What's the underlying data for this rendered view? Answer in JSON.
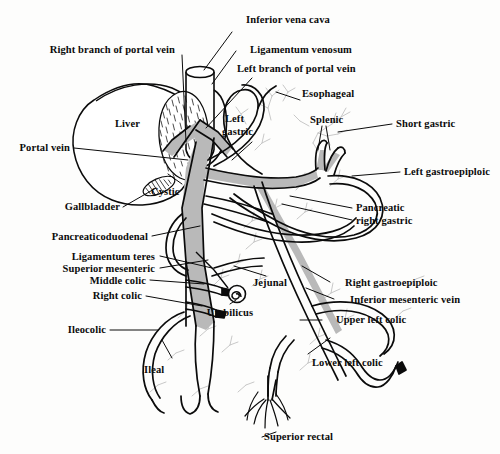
{
  "figure": {
    "background_color": "#fdfdfc",
    "ink_color": "#0b0b0b",
    "vessel_fill_color": "#b9b9b9",
    "faint_branch_color": "#bdbdbd"
  },
  "labels": {
    "inferior_vena_cava": "Inferior vena cava",
    "ligamentum_venosum": "Ligamentum venosum",
    "left_branch_of_portal_vein": "Left branch of portal vein",
    "right_branch_of_portal_vein": "Right branch of portal vein",
    "esophageal": "Esophageal",
    "splenic": "Splenic",
    "short_gastric": "Short gastric",
    "left_gastroepiploic": "Left gastroepiploic",
    "left_gastric_line1": "Left",
    "left_gastric_line2": "gastric",
    "liver": "Liver",
    "portal_vein": "Portal vein",
    "cystic": "Cystic",
    "gallbladder": "Gallbladder",
    "pancreatic": "Pancreatic",
    "right_gastric": "right gastric",
    "pancreaticoduodenal": "Pancreaticoduodenal",
    "ligamentum_teres": "Ligamentum teres",
    "superior_mesenteric": "Superior mesenteric",
    "middle_colic": "Middle colic",
    "right_colic": "Right colic",
    "ileocolic": "Ileocolic",
    "ileal": "Ileal",
    "jejunal": "Jejunal",
    "umbilicus": "Umbilicus",
    "right_gastroepiploic": "Right gastroepiploic",
    "inferior_mesenteric_vein": "Inferior mesenteric vein",
    "upper_left_colic": "Upper left colic",
    "lower_left_colic": "Lower left colic",
    "superior_rectal": "Superior rectal"
  },
  "structures": [
    {
      "name": "inferior-vena-cava",
      "kind": "vein-cylinder"
    },
    {
      "name": "liver",
      "kind": "organ-outline"
    },
    {
      "name": "caudate-lobe",
      "kind": "stippled-mass"
    },
    {
      "name": "gallbladder",
      "kind": "hatched-oval"
    },
    {
      "name": "portal-vein-trunk",
      "kind": "filled-vessel"
    },
    {
      "name": "splenic-vein",
      "kind": "filled-vessel"
    },
    {
      "name": "superior-mesenteric-vein",
      "kind": "vessel"
    },
    {
      "name": "inferior-mesenteric-vein",
      "kind": "vessel"
    },
    {
      "name": "umbilicus",
      "kind": "spiral-marker"
    },
    {
      "name": "superior-rectal-plexus",
      "kind": "vessel-tuft"
    }
  ]
}
